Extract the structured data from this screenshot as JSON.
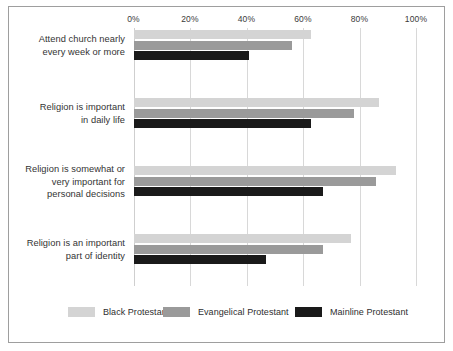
{
  "chart_data": {
    "type": "bar",
    "orientation": "horizontal",
    "title": "",
    "subtitle": "",
    "xlabel": "",
    "ylabel": "",
    "xlim": [
      0,
      100
    ],
    "grid": true,
    "legend_position": "bottom",
    "tick_labels": [
      "0%",
      "20%",
      "40%",
      "60%",
      "80%",
      "100%"
    ],
    "ticks": [
      0,
      20,
      40,
      60,
      80,
      100
    ],
    "categories": [
      "Attend church nearly every week or more",
      "Religion is important in daily life",
      "Religion is somewhat or very important for personal decisions",
      "Religion is an important part of identity"
    ],
    "category_lines": [
      [
        "Attend church nearly",
        "every week or more"
      ],
      [
        "Religion is important",
        "in daily life"
      ],
      [
        "Religion is somewhat or",
        "very important for",
        "personal decisions"
      ],
      [
        "Religion is an important",
        "part of identity"
      ]
    ],
    "series": [
      {
        "name": "Black Protestant",
        "color": "#d4d4d4",
        "values": [
          63,
          87,
          93,
          77
        ]
      },
      {
        "name": "Evangelical Protestant",
        "color": "#9a9a9a",
        "values": [
          56,
          78,
          86,
          67
        ]
      },
      {
        "name": "Mainline Protestant",
        "color": "#1a1a1a",
        "values": [
          41,
          63,
          67,
          47
        ]
      }
    ]
  },
  "axis": {
    "tick0": "0%",
    "tick1": "20%",
    "tick2": "40%",
    "tick3": "60%",
    "tick4": "80%",
    "tick5": "100%"
  },
  "legend": {
    "items": [
      {
        "label": "Black Protestant",
        "color": "#d4d4d4"
      },
      {
        "label": "Evangelical Protestant",
        "color": "#9a9a9a"
      },
      {
        "label": "Mainline Protestant",
        "color": "#1a1a1a"
      }
    ]
  },
  "colors": {
    "border": "#9e9e9e",
    "gridline": "#d8d8d8",
    "text": "#333333",
    "background": "#ffffff"
  }
}
